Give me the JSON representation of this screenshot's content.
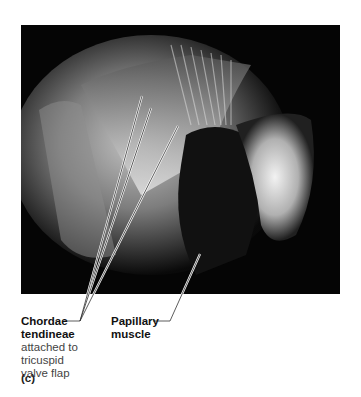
{
  "figure": {
    "panel_label": "(c)",
    "labels": [
      {
        "title_line1": "Chordae",
        "title_line2": "tendineae",
        "description": [
          "attached to",
          "tricuspid",
          "valve flap"
        ]
      },
      {
        "title_line1": "Papillary",
        "title_line2": "muscle"
      }
    ],
    "photo_description": "Photograph of heart interior showing chordae tendineae attached to papillary muscle"
  }
}
